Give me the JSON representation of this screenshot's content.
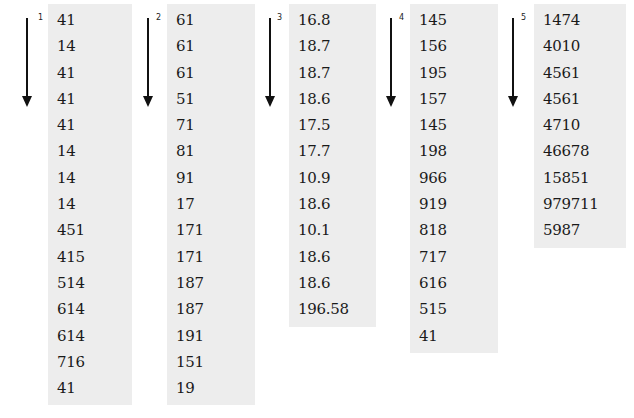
{
  "columns": [
    {
      "label": "1",
      "values": [
        "41",
        "14",
        "41",
        "41",
        "41",
        "14",
        "14",
        "14",
        "451",
        "415",
        "514",
        "614",
        "614",
        "716",
        "41"
      ]
    },
    {
      "label": "2",
      "values": [
        "61",
        "61",
        "61",
        "51",
        "71",
        "81",
        "91",
        "17",
        "171",
        "171",
        "187",
        "187",
        "191",
        "151",
        "19"
      ]
    },
    {
      "label": "3",
      "values": [
        "16.8",
        "18.7",
        "18.7",
        "18.6",
        "17.5",
        "17.7",
        "10.9",
        "18.6",
        "10.1",
        "18.6",
        "18.6",
        "196.58"
      ]
    },
    {
      "label": "4",
      "values": [
        "145",
        "156",
        "195",
        "157",
        "145",
        "198",
        "966",
        "919",
        "818",
        "717",
        "616",
        "515",
        "41"
      ]
    },
    {
      "label": "5",
      "values": [
        "1474",
        "4010",
        "4561",
        "4561",
        "4710",
        "46678",
        "15851",
        "979711",
        "5987"
      ]
    }
  ]
}
